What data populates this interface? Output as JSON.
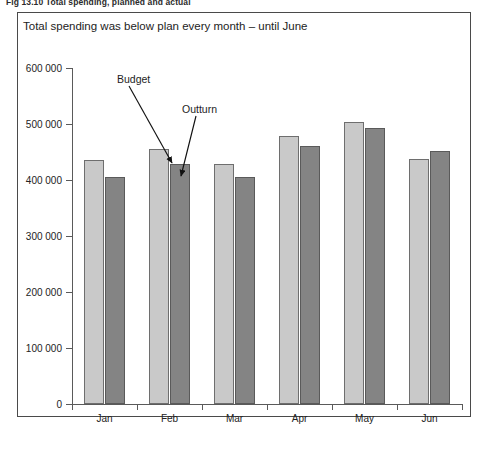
{
  "figure": {
    "caption": "Fig 13.10  Total spending, planned and actual"
  },
  "chart_data": {
    "type": "bar",
    "title": "Total spending was below plan every month – until June",
    "xlabel": "",
    "ylabel": "",
    "categories": [
      "Jan",
      "Feb",
      "Mar",
      "Apr",
      "May",
      "Jun"
    ],
    "series": [
      {
        "name": "Budget",
        "color": "#c9c9c9",
        "values": [
          435000,
          455000,
          428000,
          478000,
          503000,
          438000
        ]
      },
      {
        "name": "Outturn",
        "color": "#848484",
        "values": [
          405000,
          428000,
          406000,
          460000,
          492000,
          452000
        ]
      }
    ],
    "ylim": [
      0,
      600000
    ],
    "yticks": [
      0,
      100000,
      200000,
      300000,
      400000,
      500000,
      600000
    ],
    "ytick_labels": [
      "0",
      "100 000",
      "200 000",
      "300 000",
      "400 000",
      "500 000",
      "600 000"
    ],
    "grid": false,
    "legend": "none",
    "annotations": [
      {
        "text": "Budget",
        "target_series": "Budget",
        "target_category": "Feb"
      },
      {
        "text": "Outturn",
        "target_series": "Outturn",
        "target_category": "Feb"
      }
    ]
  },
  "colors": {
    "budget_bar": "#c9c9c9",
    "outturn_bar": "#848484",
    "axis": "#5a5a5a",
    "frame": "#4a4a4a",
    "text": "#232323",
    "background": "#ffffff"
  }
}
